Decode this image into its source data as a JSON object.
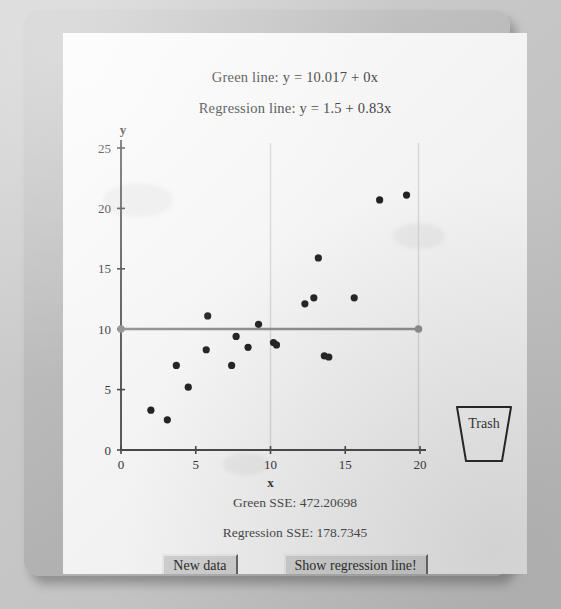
{
  "window": {
    "title": "Least Squares Regression Applet"
  },
  "captions": {
    "green_line_equation": "Green line: y = 10.017 + 0x",
    "regression_line_equation": "Regression line: y = 1.5 + 0.83x",
    "green_sse": "Green SSE: 472.20698",
    "regression_sse": "Regression SSE: 178.7345"
  },
  "buttons": {
    "new_data": "New data",
    "show_regression_line": "Show regression line!"
  },
  "trash": {
    "label": "Trash"
  },
  "colors": {
    "panel_background": "#fdfdfd",
    "frame": "#bcbcbc",
    "axis": "#3a3a3a",
    "point": "#101010",
    "green_line": "#8a8a8a",
    "gridline": "#dcdcdc",
    "button_face": "#d6d6d6"
  },
  "chart_data": {
    "type": "scatter",
    "title": "",
    "xlabel": "x",
    "ylabel": "y",
    "xlim": [
      0,
      20
    ],
    "ylim": [
      0,
      25
    ],
    "xticks": [
      0,
      5,
      10,
      15,
      20
    ],
    "yticks": [
      0,
      5,
      10,
      15,
      20,
      25
    ],
    "grid": true,
    "gridlines_x": [
      10,
      19.9
    ],
    "points": [
      {
        "x": 2.0,
        "y": 3.3
      },
      {
        "x": 3.1,
        "y": 2.5
      },
      {
        "x": 3.7,
        "y": 7.0
      },
      {
        "x": 4.5,
        "y": 5.2
      },
      {
        "x": 5.8,
        "y": 11.1
      },
      {
        "x": 5.7,
        "y": 8.3
      },
      {
        "x": 7.7,
        "y": 9.4
      },
      {
        "x": 7.4,
        "y": 7.0
      },
      {
        "x": 8.5,
        "y": 8.5
      },
      {
        "x": 9.2,
        "y": 10.4
      },
      {
        "x": 10.2,
        "y": 8.9
      },
      {
        "x": 10.4,
        "y": 8.7
      },
      {
        "x": 12.3,
        "y": 12.1
      },
      {
        "x": 12.9,
        "y": 12.6
      },
      {
        "x": 13.2,
        "y": 15.9
      },
      {
        "x": 13.6,
        "y": 7.8
      },
      {
        "x": 13.9,
        "y": 7.7
      },
      {
        "x": 15.6,
        "y": 12.6
      },
      {
        "x": 17.3,
        "y": 20.7
      },
      {
        "x": 19.1,
        "y": 21.1
      }
    ],
    "green_line": {
      "label": "Green line",
      "intercept": 10.017,
      "slope": 0,
      "x_start": 0,
      "x_end": 19.9,
      "draggable_handles": [
        {
          "x": 0,
          "y": 10.017
        },
        {
          "x": 19.9,
          "y": 10.017
        }
      ],
      "sse": 472.20698
    },
    "regression_line": {
      "label": "Regression line",
      "intercept": 1.5,
      "slope": 0.83,
      "visible": false,
      "sse": 178.7345
    }
  }
}
